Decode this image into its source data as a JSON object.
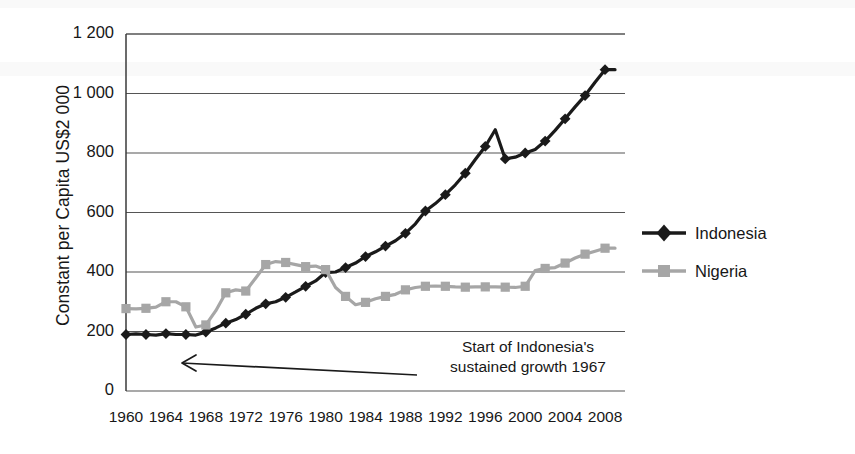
{
  "chart_data": {
    "type": "line",
    "title": "",
    "xlabel": "",
    "ylabel": "Constant per Capita US$2 000",
    "ylim": [
      0,
      1200
    ],
    "ytick_values": [
      0,
      200,
      400,
      600,
      800,
      1000,
      1200
    ],
    "ytick_labels": [
      "0",
      "200",
      "400",
      "600",
      "800",
      "1 000",
      "1 200"
    ],
    "xlim": [
      1960,
      2010
    ],
    "xtick_values": [
      1960,
      1964,
      1968,
      1972,
      1976,
      1980,
      1984,
      1988,
      1992,
      1996,
      2000,
      2004,
      2008
    ],
    "xtick_labels": [
      "1960",
      "1964",
      "1968",
      "1972",
      "1976",
      "1980",
      "1984",
      "1988",
      "1992",
      "1996",
      "2000",
      "2004",
      "2008"
    ],
    "grid": "horizontal",
    "legend_position": "right",
    "x": [
      1960,
      1961,
      1962,
      1963,
      1964,
      1965,
      1966,
      1967,
      1968,
      1969,
      1970,
      1971,
      1972,
      1973,
      1974,
      1975,
      1976,
      1977,
      1978,
      1979,
      1980,
      1981,
      1982,
      1983,
      1984,
      1985,
      1986,
      1987,
      1988,
      1989,
      1990,
      1991,
      1992,
      1993,
      1994,
      1995,
      1996,
      1997,
      1998,
      1999,
      2000,
      2001,
      2002,
      2003,
      2004,
      2005,
      2006,
      2007,
      2008,
      2009
    ],
    "series": [
      {
        "name": "Indonesia",
        "color": "#1a1a1a",
        "marker": "diamond",
        "values": [
          190,
          192,
          190,
          188,
          193,
          190,
          190,
          188,
          198,
          212,
          228,
          240,
          258,
          278,
          293,
          300,
          315,
          333,
          352,
          370,
          398,
          400,
          415,
          430,
          452,
          468,
          487,
          505,
          530,
          562,
          605,
          630,
          660,
          693,
          732,
          778,
          822,
          878,
          780,
          786,
          800,
          812,
          840,
          876,
          915,
          955,
          993,
          1038,
          1080,
          1080
        ]
      },
      {
        "name": "Nigeria",
        "color": "#a6a6a6",
        "marker": "square",
        "values": [
          277,
          276,
          278,
          282,
          300,
          300,
          283,
          215,
          222,
          270,
          330,
          340,
          336,
          380,
          425,
          435,
          432,
          425,
          418,
          420,
          408,
          348,
          318,
          290,
          298,
          310,
          318,
          325,
          340,
          348,
          352,
          353,
          352,
          350,
          349,
          350,
          350,
          350,
          349,
          348,
          352,
          405,
          412,
          415,
          430,
          447,
          460,
          470,
          480,
          480
        ]
      }
    ],
    "annotations": [
      {
        "text_line1": "Start of Indonesia's",
        "text_line2": "sustained growth 1967",
        "arrow": "arrow-pointing-left-to-1967"
      }
    ]
  },
  "legend": {
    "items": [
      {
        "label": "Indonesia"
      },
      {
        "label": "Nigeria"
      }
    ]
  }
}
